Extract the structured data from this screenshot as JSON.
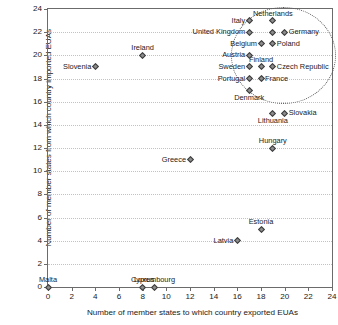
{
  "chart_data": {
    "type": "scatter",
    "title": "",
    "xlabel": "Number of member states to which country exported EUAs",
    "ylabel": "Number of member states from which country imported EUAs",
    "xlim": [
      0,
      24
    ],
    "ylim": [
      0,
      24
    ],
    "xticks": [
      0,
      2,
      4,
      6,
      8,
      10,
      12,
      14,
      16,
      18,
      20,
      22,
      24
    ],
    "yticks": [
      0,
      2,
      4,
      6,
      8,
      10,
      12,
      14,
      16,
      18,
      20,
      22,
      24
    ],
    "grid": "horizontal-dotted",
    "legend": "none",
    "marker": "diamond",
    "marker_color": "#8c8c8c",
    "marker_edge_color": "#3d3d3d",
    "points": [
      {
        "label": "Malta",
        "x": 0,
        "y": 0,
        "label_pos": "above"
      },
      {
        "label": "Cyprus",
        "x": 8,
        "y": 0,
        "label_pos": "above"
      },
      {
        "label": "Luxembourg",
        "x": 9,
        "y": 0,
        "label_pos": "above"
      },
      {
        "label": "Latvia",
        "x": 16,
        "y": 4,
        "label_pos": "left"
      },
      {
        "label": "Estonia",
        "x": 18,
        "y": 5,
        "label_pos": "above"
      },
      {
        "label": "Greece",
        "x": 12,
        "y": 11,
        "label_pos": "left"
      },
      {
        "label": "Hungary",
        "x": 19,
        "y": 12,
        "label_pos": "above"
      },
      {
        "label": "Lithuania",
        "x": 19,
        "y": 15,
        "label_pos": "below"
      },
      {
        "label": "Slovakia",
        "x": 20,
        "y": 15,
        "label_pos": "right"
      },
      {
        "label": "Denmark",
        "x": 17,
        "y": 17,
        "label_pos": "below"
      },
      {
        "label": "Portugal",
        "x": 17,
        "y": 18,
        "label_pos": "left"
      },
      {
        "label": "France",
        "x": 18,
        "y": 18,
        "label_pos": "right"
      },
      {
        "label": "Slovenia",
        "x": 4,
        "y": 19,
        "label_pos": "left"
      },
      {
        "label": "Sweden",
        "x": 17,
        "y": 19,
        "label_pos": "left"
      },
      {
        "label": "Finland",
        "x": 18,
        "y": 19,
        "label_pos": "above"
      },
      {
        "label": "Czech Republic",
        "x": 19,
        "y": 19,
        "label_pos": "right"
      },
      {
        "label": "Ireland",
        "x": 8,
        "y": 20,
        "label_pos": "above"
      },
      {
        "label": "Austria",
        "x": 17,
        "y": 20,
        "label_pos": "left"
      },
      {
        "label": "Belgium",
        "x": 18,
        "y": 21,
        "label_pos": "left"
      },
      {
        "label": "Poland",
        "x": 19,
        "y": 21,
        "label_pos": "right"
      },
      {
        "label": "United Kingdom",
        "x": 17,
        "y": 22,
        "label_pos": "left"
      },
      {
        "label": "Germany",
        "x": 20,
        "y": 22,
        "label_pos": "right"
      },
      {
        "label": "Spain",
        "x": 19,
        "y": 22,
        "label_pos": "none"
      },
      {
        "label": "Italy",
        "x": 17,
        "y": 23,
        "label_pos": "left"
      },
      {
        "label": "Netherlands",
        "x": 19,
        "y": 23,
        "label_pos": "above"
      }
    ],
    "annotations": [
      {
        "type": "ellipse",
        "name": "cluster-highlight",
        "style": "dotted",
        "cx": 19.9,
        "cy": 20.0,
        "rx": 4.45,
        "ry": 4.2
      }
    ]
  }
}
